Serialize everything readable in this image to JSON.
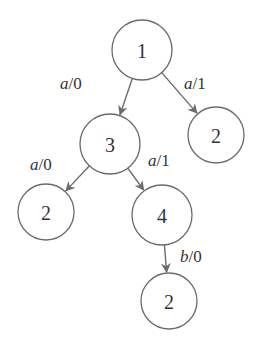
{
  "diagram": {
    "type": "tree",
    "nodes": [
      {
        "id": "n1",
        "label": "1",
        "cx": 142,
        "cy": 50,
        "r": 30
      },
      {
        "id": "n3",
        "label": "3",
        "cx": 110,
        "cy": 144,
        "r": 30
      },
      {
        "id": "n2a",
        "label": "2",
        "cx": 216,
        "cy": 135,
        "r": 28
      },
      {
        "id": "n2b",
        "label": "2",
        "cx": 46,
        "cy": 212,
        "r": 28
      },
      {
        "id": "n4",
        "label": "4",
        "cx": 162,
        "cy": 215,
        "r": 30
      },
      {
        "id": "n2c",
        "label": "2",
        "cx": 169,
        "cy": 301,
        "r": 28
      }
    ],
    "edges": [
      {
        "from": "n1",
        "to": "n3",
        "input": "a",
        "output": "/0",
        "label_x": 60,
        "label_y": 89
      },
      {
        "from": "n1",
        "to": "n2a",
        "input": "a",
        "output": "/1",
        "label_x": 184,
        "label_y": 89
      },
      {
        "from": "n3",
        "to": "n2b",
        "input": "a",
        "output": "/0",
        "label_x": 30,
        "label_y": 170
      },
      {
        "from": "n3",
        "to": "n4",
        "input": "a",
        "output": "/1",
        "label_x": 148,
        "label_y": 166
      },
      {
        "from": "n4",
        "to": "n2c",
        "input": "b",
        "output": "/0",
        "label_x": 180,
        "label_y": 262
      }
    ]
  }
}
